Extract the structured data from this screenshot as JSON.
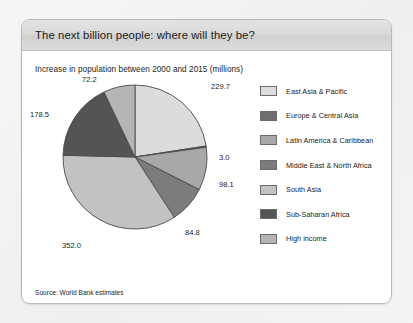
{
  "panel": {
    "title": "The next billion people: where will they be?",
    "subtitle": "Increase in population between 2000 and 2015 (millions)",
    "source": "Source: World Bank estimates"
  },
  "colors": {
    "background": "#f2f2f2",
    "panel_background": "#ffffff",
    "header_gradient_top": "#e3e3e3",
    "header_gradient_bottom": "#dcdcdc",
    "panel_border": "#b9b9b9",
    "slice_outline": "#4a4a4a",
    "text": "#1d1d1d"
  },
  "chart_data": {
    "type": "pie",
    "title": "The next billion people: where will they be?",
    "subtitle": "Increase in population between 2000 and 2015 (millions)",
    "unit": "millions",
    "total": 1018.3,
    "start_angle_deg": 0,
    "direction": "clockwise",
    "legend_position": "right",
    "grid": false,
    "categories": [
      "East Asia & Pacific",
      "Europe & Central Asia",
      "Latin America & Caribbean",
      "Middle East & North Africa",
      "South Asia",
      "Sub-Saharan Africa",
      "High income"
    ],
    "values": [
      229.7,
      3.0,
      98.1,
      84.8,
      352.0,
      178.5,
      72.2
    ],
    "labels": [
      "229.7",
      "3.0",
      "98.1",
      "84.8",
      "352.0",
      "178.5",
      "72.2"
    ],
    "slice_colors": [
      "#dcdcdc",
      "#6e6e6e",
      "#a8a8a8",
      "#7c7c7c",
      "#c2c2c2",
      "#545454",
      "#b5b5b5"
    ],
    "annotations": [
      "Source: World Bank estimates"
    ]
  },
  "legend": {
    "items": [
      {
        "label": "East Asia & Pacific",
        "color": "#dcdcdc"
      },
      {
        "label": "Europe & Central Asia",
        "color": "#6e6e6e"
      },
      {
        "label": "Latin America & Caribbean",
        "color": "#a8a8a8"
      },
      {
        "label": "Middle East & North Africa",
        "color": "#7c7c7c"
      },
      {
        "label": "South Asia",
        "color": "#c2c2c2"
      },
      {
        "label": "Sub-Saharan Africa",
        "color": "#545454"
      },
      {
        "label": "High income",
        "color": "#b5b5b5"
      }
    ]
  }
}
